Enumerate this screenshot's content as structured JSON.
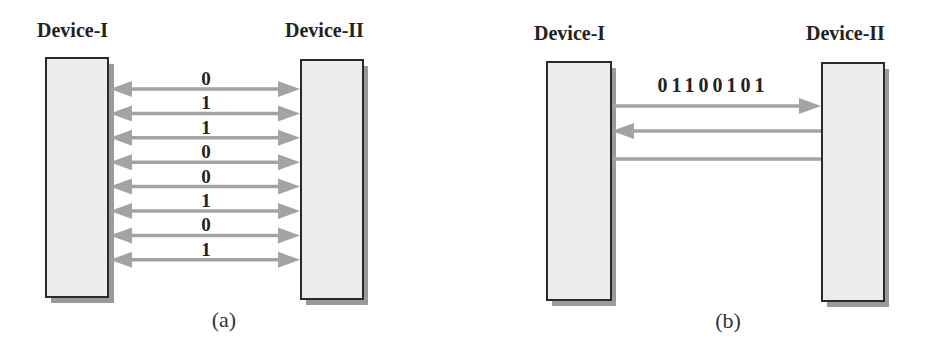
{
  "diagram_a": {
    "caption": "(a)",
    "device_left_label": "Device-I",
    "device_right_label": "Device-II",
    "mode": "parallel",
    "bits": [
      "0",
      "1",
      "1",
      "0",
      "0",
      "1",
      "0",
      "1"
    ],
    "arrow_direction": "bidirectional"
  },
  "diagram_b": {
    "caption": "(b)",
    "device_left_label": "Device-I",
    "device_right_label": "Device-II",
    "mode": "serial",
    "bit_string": "01100101",
    "lines": [
      {
        "direction": "left-to-right",
        "label": "01100101"
      },
      {
        "direction": "right-to-left",
        "label": ""
      },
      {
        "direction": "none",
        "label": ""
      }
    ]
  },
  "colors": {
    "device_fill": "#ececec",
    "device_border": "#2a2a2a",
    "device_shadow": "#9a9a9a",
    "arrow": "#a3a3a3",
    "text": "#222222"
  }
}
